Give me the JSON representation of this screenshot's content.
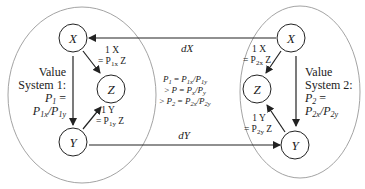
{
  "left_system": {
    "label_line1": "Value",
    "label_line2": "System 1:",
    "label_line3_P": "P",
    "label_line3_sub": "1",
    "label_line3_eq": " =",
    "label_line4": "P1x/P1y",
    "nodes": {
      "x": "X",
      "y": "Y",
      "z": "Z"
    },
    "x_to_z": {
      "line1": "1 X",
      "line2_prefix": "= P",
      "line2_sub": "1x",
      "line2_suffix": " Z"
    },
    "y_to_z": {
      "line1": "1 Y",
      "line2_prefix": "= P",
      "line2_sub": "1y",
      "line2_suffix": " Z"
    }
  },
  "right_system": {
    "label_line1": "Value",
    "label_line2": "System 2:",
    "label_line3_P": "P",
    "label_line3_sub": "2",
    "label_line3_eq": " =",
    "label_line4": "P2x/P2y",
    "nodes": {
      "x": "X",
      "y": "Y",
      "z": "Z"
    },
    "x_to_z": {
      "line1": "1 X",
      "line2_prefix": "= P",
      "line2_sub": "2x",
      "line2_suffix": " Z"
    },
    "y_to_z": {
      "line1": "1 Y",
      "line2_prefix": "= P",
      "line2_sub": "2y",
      "line2_suffix": " Z"
    }
  },
  "flows": {
    "dx_label": "dX",
    "dy_label": "dY"
  },
  "center_relation": {
    "line1": "P1 = P1x/P1y",
    "line2": "> P = Px/Py",
    "line3": "> P2 = P2x/P2y"
  },
  "colors": {
    "stroke": "#222222",
    "ellipse": "#888888",
    "background": "#ffffff"
  }
}
